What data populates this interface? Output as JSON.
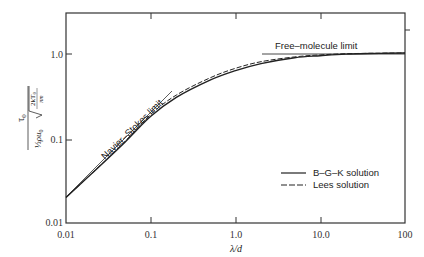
{
  "chart_data": {
    "type": "line",
    "title": "",
    "xlabel": "λ/d",
    "ylabel": "τ0 / (½ ρ u0 √(2kT0/πm))",
    "xscale": "log",
    "yscale": "log",
    "xlim": [
      0.01,
      100
    ],
    "ylim": [
      0.01,
      2.9
    ],
    "grid": false,
    "x_ticks": [
      "0.01",
      "0.1",
      "1.0",
      "10.0",
      "100"
    ],
    "y_ticks": [
      "0.01",
      "0.1",
      "1.0"
    ],
    "legend_position": "lower right",
    "series": [
      {
        "name": "B-G-K solution",
        "style": "solid",
        "x": [
          0.01,
          0.02,
          0.05,
          0.1,
          0.2,
          0.5,
          1.0,
          2.0,
          5.0,
          10.0,
          20.0,
          50.0,
          100.0
        ],
        "values": [
          0.02,
          0.038,
          0.09,
          0.18,
          0.3,
          0.48,
          0.62,
          0.75,
          0.88,
          0.93,
          0.97,
          0.99,
          1.0
        ]
      },
      {
        "name": "Lees solution",
        "style": "dashed",
        "x": [
          0.01,
          0.02,
          0.05,
          0.1,
          0.2,
          0.5,
          1.0,
          2.0,
          5.0,
          10.0,
          20.0,
          50.0,
          100.0
        ],
        "values": [
          0.02,
          0.038,
          0.092,
          0.19,
          0.32,
          0.51,
          0.66,
          0.79,
          0.9,
          0.95,
          0.98,
          0.995,
          1.0
        ]
      }
    ],
    "reference_lines": [
      {
        "name": "Navier-Stokes limit",
        "x": [
          0.01,
          0.17
        ],
        "values": [
          0.02,
          0.34
        ]
      },
      {
        "name": "Free-molecule limit",
        "x": [
          2.0,
          100.0
        ],
        "values": [
          1.0,
          1.0
        ]
      }
    ],
    "annotations": [
      "Navier-Stokes limit",
      "Free-molecule limit"
    ]
  },
  "axes": {
    "x_tick_labels": [
      "0.01",
      "0.1",
      "1.0",
      "10.0",
      "100"
    ],
    "y_tick_labels": [
      "0.01",
      "0.1",
      "1.0"
    ],
    "xlabel": "λ/d",
    "ylabel": {
      "numerator": "τ",
      "numerator_sub": "0",
      "denominator_frac": "½",
      "denominator_rho": "ρu",
      "denominator_sub": "0",
      "sqrt_num": "2kT",
      "sqrt_num_sub": "0",
      "sqrt_den": "πm"
    }
  },
  "annotations": {
    "navier_stokes": "Navier–Stokes limit",
    "free_molecule": "Free–molecule limit"
  },
  "legend": {
    "items": [
      {
        "label": "B–G–K solution",
        "style": "solid"
      },
      {
        "label": "Lees solution",
        "style": "dashed"
      }
    ]
  },
  "colors": {
    "line": "#222222",
    "axis": "#333333"
  }
}
